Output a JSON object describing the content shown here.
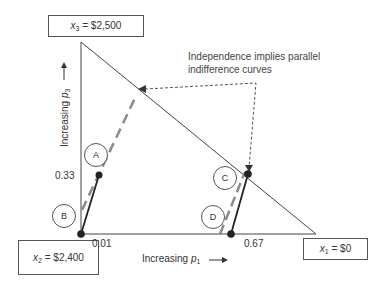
{
  "diagram": {
    "vertices": {
      "top": {
        "var": "x",
        "sub": "3",
        "eq": " = $2,500"
      },
      "bottom_left": {
        "var": "x",
        "sub": "2",
        "eq": " = $2,400"
      },
      "bottom_right": {
        "var": "x",
        "sub": "1",
        "eq": " = $0"
      }
    },
    "axes": {
      "x_label": {
        "text": "Increasing ",
        "var": "p",
        "sub": "1",
        "arrow": "⟶"
      },
      "y_label": {
        "text": "Increasing ",
        "var": "p",
        "sub": "3",
        "arrow": "⟶"
      }
    },
    "tick_labels": {
      "p3_a": "0.33",
      "p1_b": "0.01",
      "p1_d": "0.67"
    },
    "points": [
      {
        "id": "A",
        "label": "A"
      },
      {
        "id": "B",
        "label": "B"
      },
      {
        "id": "C",
        "label": "C"
      },
      {
        "id": "D",
        "label": "D"
      }
    ],
    "annotation": {
      "line1": "Independence implies parallel",
      "line2": "indifference curves"
    },
    "colors": {
      "line": "#333333",
      "indifference": "#888888",
      "dots": "#222222"
    }
  }
}
